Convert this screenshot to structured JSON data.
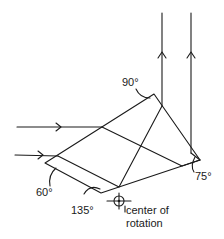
{
  "diagram": {
    "type": "optical prism ray diagram",
    "angles": [
      {
        "id": "top",
        "label": "90°"
      },
      {
        "id": "left",
        "label": "60°"
      },
      {
        "id": "bottom",
        "label": "135°"
      },
      {
        "id": "right",
        "label": "75°"
      }
    ],
    "center_label_line1": "center of",
    "center_label_line2": "rotation",
    "incoming_rays": 2,
    "outgoing_rays": 2,
    "line_color": "#1a1a1a",
    "background": "#ffffff"
  }
}
